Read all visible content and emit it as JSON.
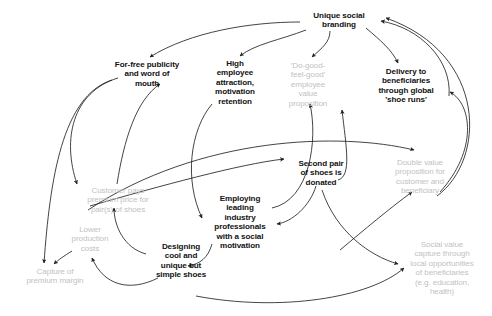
{
  "diagram": {
    "background_color": "#ffffff",
    "bold_node_color": "#111111",
    "faded_node_color": "#c2c2c2",
    "edge_color": "#222222",
    "nodes": [
      {
        "id": "unique-social-branding",
        "label": "Unique social\nbranding",
        "style": "bold",
        "x": 302,
        "y": 11,
        "width": 74
      },
      {
        "id": "for-free-publicity",
        "label": "For-free publicity\nand word of\nmouth",
        "style": "bold",
        "x": 108,
        "y": 60,
        "width": 78
      },
      {
        "id": "high-employee-attraction",
        "label": "High\nemployee\nattraction,\nmotivation\nretention",
        "style": "bold",
        "x": 204,
        "y": 59,
        "width": 62
      },
      {
        "id": "do-good-feel-good",
        "label": "'Do-good-\nfeel-good'\nemployee\nvalue\nproposition",
        "style": "faded",
        "x": 277,
        "y": 61,
        "width": 62
      },
      {
        "id": "delivery-to-beneficiaries",
        "label": "Delivery to\nbeneficiaries\nthrough global\n'shoe runs'",
        "style": "bold",
        "x": 368,
        "y": 67,
        "width": 76
      },
      {
        "id": "second-pair-donated",
        "label": "Second pair\nof shoes is\ndonated",
        "style": "bold",
        "x": 288,
        "y": 159,
        "width": 66
      },
      {
        "id": "double-value-proposition",
        "label": "Double value\nproposition for\ncustomer and\nbeneficiary",
        "style": "faded",
        "x": 380,
        "y": 158,
        "width": 80
      },
      {
        "id": "customer-pays-premium",
        "label": "Customer pays\npremium price for\npair(s) of shoes",
        "style": "faded",
        "x": 73,
        "y": 186,
        "width": 90
      },
      {
        "id": "employing-leading-professionals",
        "label": "Employing\nleading\nindustry\nprofessionals\nwith a social\nmotivation",
        "style": "bold",
        "x": 206,
        "y": 194,
        "width": 68
      },
      {
        "id": "lower-production-costs",
        "label": "Lower\nproduction\ncosts",
        "style": "faded",
        "x": 64,
        "y": 225,
        "width": 52
      },
      {
        "id": "designing-cool-shoes",
        "label": "Designing\ncool and\nunique but\nsimple shoes",
        "style": "bold",
        "x": 148,
        "y": 242,
        "width": 66
      },
      {
        "id": "capture-of-premium-margin",
        "label": "Capture of\npremium margin",
        "style": "faded",
        "x": 14,
        "y": 267,
        "width": 82
      },
      {
        "id": "social-value-capture",
        "label": "Social value\ncapture through\nlocal opportunities\nof beneficiaries\n(e.g. education,\nhealth)",
        "style": "faded",
        "x": 396,
        "y": 240,
        "width": 92
      }
    ],
    "edges": [
      {
        "id": "branding-to-publicity",
        "from": "unique-social-branding",
        "to": "for-free-publicity",
        "path": "M 300 22 C 250 22 190 32 150 57"
      },
      {
        "id": "branding-to-high-employee",
        "from": "unique-social-branding",
        "to": "high-employee-attraction",
        "path": "M 306 30 C 280 40 255 44 240 56"
      },
      {
        "id": "branding-to-do-good",
        "from": "unique-social-branding",
        "to": "do-good-feel-good",
        "path": "M 330 31 C 330 42 322 48 312 57"
      },
      {
        "id": "branding-to-delivery",
        "from": "unique-social-branding",
        "to": "delivery-to-beneficiaries",
        "path": "M 366 28 C 380 40 392 50 398 63"
      },
      {
        "id": "delivery-to-branding",
        "from": "delivery-to-beneficiaries",
        "to": "unique-social-branding",
        "path": "M 449 96 C 452 60 420 28 381 21"
      },
      {
        "id": "publicity-to-customer-pays",
        "from": "for-free-publicity",
        "to": "customer-pays-premium",
        "path": "M 118 78 C 72 92 62 140 77 184"
      },
      {
        "id": "publicity-to-capture-margin",
        "from": "for-free-publicity",
        "to": "capture-of-premium-margin",
        "path": "M 112 80 C 62 96 50 180 44 263"
      },
      {
        "id": "customer-pays-to-publicity",
        "from": "customer-pays-premium",
        "to": "for-free-publicity",
        "path": "M 117 184 C 124 140 136 100 160 84"
      },
      {
        "id": "high-employee-to-employing",
        "from": "high-employee-attraction",
        "to": "employing-leading-professionals",
        "path": "M 212 104 C 190 130 184 180 202 218"
      },
      {
        "id": "employing-to-do-good",
        "from": "employing-leading-professionals",
        "to": "do-good-feel-good",
        "path": "M 272 208 C 310 200 318 140 310 104"
      },
      {
        "id": "second-pair-to-employing",
        "from": "second-pair-donated",
        "to": "employing-leading-professionals",
        "path": "M 316 186 C 310 206 292 222 277 224"
      },
      {
        "id": "second-pair-to-delivery",
        "from": "second-pair-donated",
        "to": "delivery-to-beneficiaries",
        "path": "M 338 180 C 352 176 346 146 342 110"
      },
      {
        "id": "employing-to-designing",
        "from": "employing-leading-professionals",
        "to": "designing-cool-shoes",
        "path": "M 212 244 C 208 258 200 264 188 266"
      },
      {
        "id": "designing-to-customer-pays",
        "from": "designing-cool-shoes",
        "to": "customer-pays-premium",
        "path": "M 146 254 C 124 248 114 226 114 208"
      },
      {
        "id": "designing-to-lower-costs",
        "from": "designing-cool-shoes",
        "to": "lower-production-costs",
        "path": "M 158 278 C 130 292 104 286 92 258"
      },
      {
        "id": "lower-costs-to-capture-margin",
        "from": "lower-production-costs",
        "to": "capture-of-premium-margin",
        "path": "M 72 251 C 64 256 58 260 54 264"
      },
      {
        "id": "customer-pays-to-second-pair",
        "from": "customer-pays-premium",
        "to": "second-pair-donated",
        "path": "M 90 206 C 160 186 240 164 284 159"
      },
      {
        "id": "long-left-to-double-value",
        "from": "customer-pays-premium",
        "to": "double-value-proposition",
        "path": "M 88 210 C 200 136 340 132 414 150"
      },
      {
        "id": "designing-to-social-value",
        "from": "designing-cool-shoes",
        "to": "social-value-capture",
        "path": "M 196 296 C 280 312 370 298 404 268"
      },
      {
        "id": "second-pair-to-social-value",
        "from": "second-pair-donated",
        "to": "social-value-capture",
        "path": "M 322 190 C 336 232 370 256 398 264"
      },
      {
        "id": "social-value-to-double-value",
        "from": "social-value-capture",
        "to": "double-value-proposition",
        "path": "M 340 250 C 364 230 390 208 412 192"
      },
      {
        "id": "double-value-to-branding-outer",
        "from": "double-value-proposition",
        "to": "unique-social-branding",
        "path": "M 437 196 C 486 160 488 54 386 18"
      },
      {
        "id": "double-value-to-delivery",
        "from": "double-value-proposition",
        "to": "delivery-to-beneficiaries",
        "path": "M 440 192 C 478 150 472 104 450 92"
      }
    ]
  }
}
